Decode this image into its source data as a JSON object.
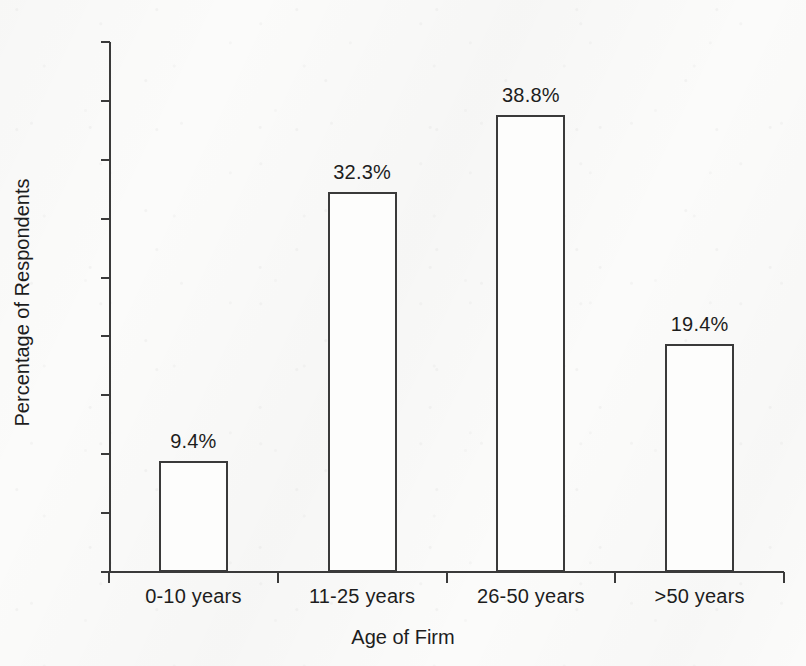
{
  "chart_data": {
    "type": "bar",
    "title": "",
    "subtitle": "",
    "xlabel": "Age of Firm",
    "ylabel": "Percentage of Respondents",
    "categories": [
      "0-10 years",
      "11-25 years",
      "26-50 years",
      ">50 years"
    ],
    "values": [
      9.4,
      32.3,
      38.8,
      19.4
    ],
    "data_labels": [
      "9.4%",
      "32.3%",
      "38.8%",
      "19.4%"
    ],
    "ylim": [
      0,
      45
    ],
    "ytick_values": [
      0,
      5,
      10,
      15,
      20,
      25,
      30,
      35,
      40,
      45
    ],
    "ytick_labels": [
      "0%",
      "5%",
      "10%",
      "15%",
      "20%",
      "25%",
      "30%",
      "35%",
      "40%",
      "45%"
    ],
    "grid": false,
    "legend": null,
    "legend_position": "none",
    "series": [
      {
        "name": "Percentage of Respondents",
        "values": [
          9.4,
          32.3,
          38.8,
          19.4
        ]
      }
    ],
    "colors": {
      "bar_fill": "#fdfdfc",
      "bar_outline": "#3a3a3a",
      "axis": "#3a3a3a",
      "text": "#1d1d1d",
      "background": "#fbfbfa"
    }
  }
}
